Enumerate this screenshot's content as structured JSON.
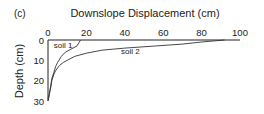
{
  "panel_label": "(c)",
  "chart_data": {
    "type": "line",
    "title": "Downslope Displacement (cm)",
    "xlabel": "Downslope Displacement (cm)",
    "ylabel": "Depth (cm)",
    "xlim": [
      0,
      100
    ],
    "ylim": [
      30,
      0
    ],
    "x_axis_position": "top",
    "y_inverted": true,
    "grid": false,
    "x_ticks": [
      0,
      20,
      40,
      60,
      80,
      100
    ],
    "y_ticks": [
      0,
      10,
      20,
      30
    ],
    "series": [
      {
        "name": "soil 1",
        "points": [
          [
            17,
            0
          ],
          [
            15,
            3
          ],
          [
            12,
            4.5
          ],
          [
            9,
            6
          ],
          [
            7,
            8
          ],
          [
            5,
            11
          ],
          [
            4,
            13
          ],
          [
            3,
            16
          ],
          [
            2,
            19
          ],
          [
            1.5,
            22
          ],
          [
            1,
            25
          ],
          [
            0.5,
            28
          ],
          [
            0,
            30
          ]
        ]
      },
      {
        "name": "soil 2",
        "points": [
          [
            92,
            0
          ],
          [
            80,
            1
          ],
          [
            70,
            2
          ],
          [
            55,
            3
          ],
          [
            40,
            4
          ],
          [
            28,
            5
          ],
          [
            20,
            6.5
          ],
          [
            14,
            8
          ],
          [
            11,
            9.5
          ],
          [
            8,
            11
          ],
          [
            6,
            12.5
          ],
          [
            4,
            15
          ],
          [
            3,
            17
          ],
          [
            2,
            20
          ],
          [
            1.5,
            23
          ],
          [
            0.8,
            26
          ],
          [
            0,
            29
          ]
        ]
      }
    ],
    "annotations": [
      {
        "text": "soil 1",
        "x": 3,
        "y": 2.5
      },
      {
        "text": "soil 2",
        "x": 38,
        "y": 5.5
      }
    ]
  }
}
